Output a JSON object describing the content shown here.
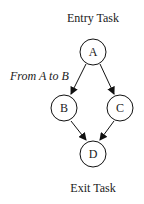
{
  "diagram": {
    "entry_label": "Entry Task",
    "exit_label": "Exit Task",
    "edge_label": "From A to B",
    "nodes": [
      {
        "id": "A",
        "label": "A"
      },
      {
        "id": "B",
        "label": "B"
      },
      {
        "id": "C",
        "label": "C"
      },
      {
        "id": "D",
        "label": "D"
      }
    ],
    "edges": [
      {
        "from": "A",
        "to": "B"
      },
      {
        "from": "A",
        "to": "C"
      },
      {
        "from": "B",
        "to": "D"
      },
      {
        "from": "C",
        "to": "D"
      }
    ]
  }
}
